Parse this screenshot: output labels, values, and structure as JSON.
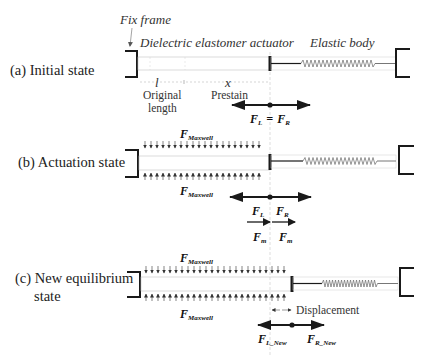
{
  "figure": {
    "annotations": {
      "fix_frame": "Fix frame",
      "actuator": "Dielectric elastomer actuator",
      "elastic_body": "Elastic body"
    },
    "rows": [
      {
        "id": "a",
        "label": "(a) Initial state",
        "dims": {
          "l_symbol": "l",
          "x_symbol": "x",
          "original_length_line1": "Original",
          "original_length_line2": "length",
          "prestain": "Prestain"
        },
        "forces": {
          "FL": "F",
          "FL_sub": "L",
          "eq": "=",
          "FR": "F",
          "FR_sub": "R"
        }
      },
      {
        "id": "b",
        "label": "(b) Actuation state",
        "maxwell_top": "F",
        "maxwell_top_sub": "Maxwell",
        "maxwell_bottom": "F",
        "maxwell_bottom_sub": "Maxwell",
        "forces": {
          "FL": "F",
          "FL_sub": "L",
          "FR": "F",
          "FR_sub": "R",
          "Fm_left": "F",
          "Fm_left_sub": "m",
          "Fm_right": "F",
          "Fm_right_sub": "m"
        }
      },
      {
        "id": "c",
        "label_line1": "(c) New equilibrium",
        "label_line2": "state",
        "maxwell_top": "F",
        "maxwell_top_sub": "Maxwell",
        "maxwell_bottom": "F",
        "maxwell_bottom_sub": "Maxwell",
        "displacement": "Displacement",
        "forces": {
          "FL": "F",
          "FL_sub": "L_New",
          "FR": "F",
          "FR_sub": "R_New"
        }
      }
    ],
    "colors": {
      "frame": "#1a1a1a",
      "band": "#bdbdbd",
      "spring": "#777777",
      "arrow": "#1a1a1a",
      "guide": "#c8c8c8"
    }
  }
}
